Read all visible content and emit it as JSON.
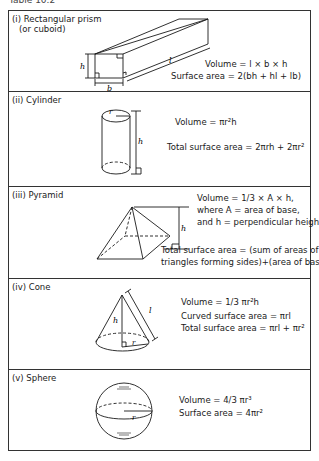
{
  "caption": "Table 10.2",
  "shapes": [
    {
      "label": "(i) Rectangular prism",
      "label_line2": "(or cuboid)",
      "dims": {
        "h": "h",
        "b": "b",
        "l": "l"
      },
      "formulas": {
        "volume": "Volume = l × b × h",
        "surface_area": "Surface area = 2(bh + hl + lb)"
      }
    },
    {
      "label": "(ii) Cylinder",
      "dims": {
        "r": "r",
        "h": "h"
      },
      "formulas": {
        "volume": "Volume = πr²h",
        "surface_area": "Total surface area = 2πrh + 2πr²"
      }
    },
    {
      "label": "(iii) Pyramid",
      "dims": {
        "h": "h"
      },
      "formulas": {
        "volume": "Volume = 1/3 × A × h,",
        "where1": "where A = area of base,",
        "where2": "and h = perpendicular height",
        "surface_area_1": "Total surface area = (sum of areas of",
        "surface_area_2": "triangles forming sides)+(area of base)"
      }
    },
    {
      "label": "(iv) Cone",
      "dims": {
        "h": "h",
        "r": "r",
        "l": "l"
      },
      "formulas": {
        "volume": "Volume = 1/3 πr²h",
        "curved_area": "Curved surface area = πrl",
        "surface_area": "Total surface area = πrl + πr²"
      }
    },
    {
      "label": "(v) Sphere",
      "dims": {
        "r": "r"
      },
      "formulas": {
        "volume": "Volume = 4/3 πr³",
        "surface_area": "Surface area = 4πr²"
      }
    }
  ]
}
